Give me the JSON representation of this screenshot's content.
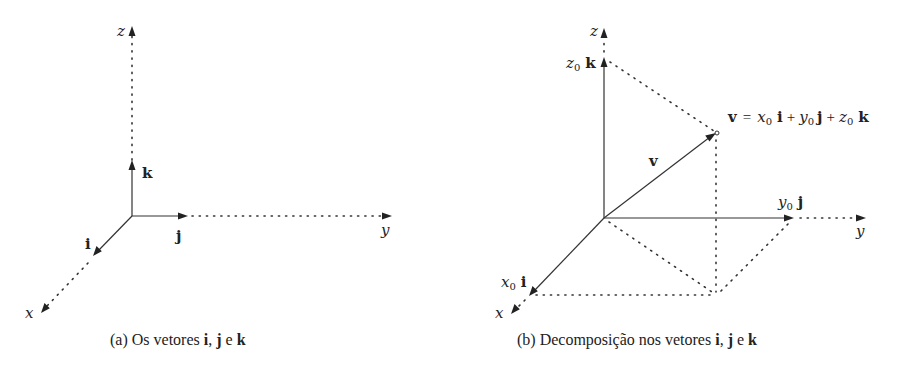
{
  "figure_a": {
    "caption_tag": "(a)",
    "caption_text": "Os vetores",
    "caption_v1": "i",
    "caption_sep1": ",",
    "caption_v2": "j",
    "caption_conj": "e",
    "caption_v3": "k",
    "axis_labels": {
      "x": "x",
      "y": "y",
      "z": "z"
    },
    "vector_labels": {
      "i": "i",
      "j": "j",
      "k": "k"
    }
  },
  "figure_b": {
    "caption_tag": "(b)",
    "caption_text": "Decomposição nos vetores",
    "caption_v1": "i",
    "caption_sep1": ",",
    "caption_v2": "j",
    "caption_conj": "e",
    "caption_v3": "k",
    "axis_labels": {
      "x": "x",
      "y": "y",
      "z": "z"
    },
    "vector_label": "v",
    "component_labels": {
      "x0": "x",
      "x0_sub": "0",
      "i": "i",
      "y0": "y",
      "y0_sub": "0",
      "j": "j",
      "z0": "z",
      "z0_sub": "0",
      "k": "k"
    },
    "equation": {
      "lhs": "v",
      "eq": "=",
      "x": "x",
      "x_sub": "0",
      "i": "i",
      "plus1": "+",
      "y": "y",
      "y_sub": "0",
      "j": "j",
      "plus2": "+",
      "z": "z",
      "z_sub": "0",
      "k": "k"
    }
  },
  "colors": {
    "ink": "#222222",
    "background": "#ffffff"
  }
}
